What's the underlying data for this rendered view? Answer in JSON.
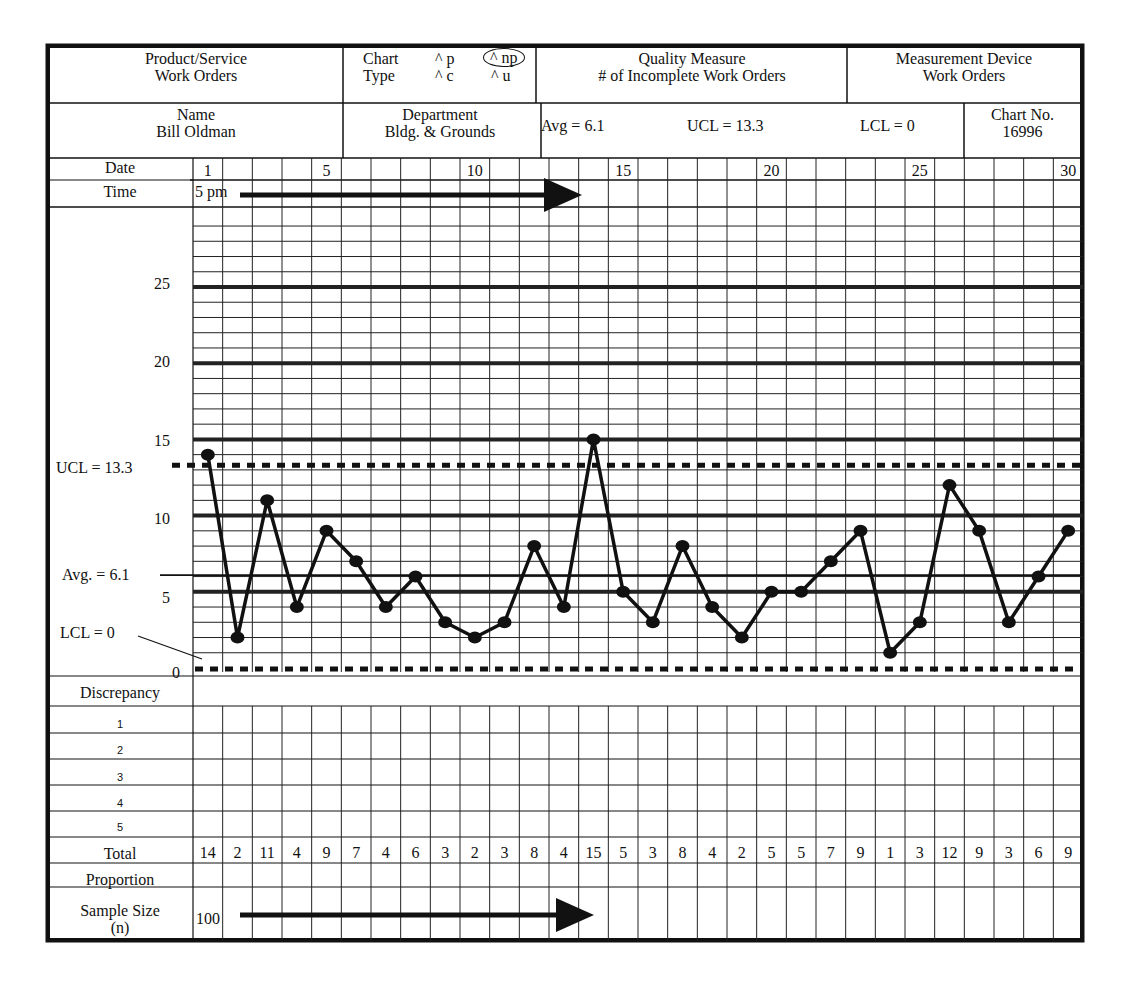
{
  "header": {
    "product_service_label": "Product/Service",
    "product_service_value": "Work Orders",
    "chart_type_label_1": "Chart",
    "chart_type_label_2": "Type",
    "chart_type_options": [
      "^ p",
      "^ np",
      "^ c",
      "^ u"
    ],
    "chart_type_selected": "np",
    "quality_measure_label": "Quality Measure",
    "quality_measure_value": "# of Incomplete Work Orders",
    "measurement_device_label": "Measurement Device",
    "measurement_device_value": "Work Orders",
    "name_label": "Name",
    "name_value": "Bill Oldman",
    "department_label": "Department",
    "department_value": "Bldg. & Grounds",
    "avg_text": "Avg = 6.1",
    "ucl_text": "UCL = 13.3",
    "lcl_text": "LCL = 0",
    "chart_no_label": "Chart No.",
    "chart_no_value": "16996"
  },
  "rows": {
    "date_label": "Date",
    "time_label": "Time",
    "time_value": "5 pm",
    "date_ticks": [
      "1",
      "5",
      "10",
      "15",
      "20",
      "25",
      "30"
    ],
    "discrepancy_label": "Discrepancy",
    "discrepancy_items": [
      "1",
      "2",
      "3",
      "4",
      "5"
    ],
    "total_label": "Total",
    "proportion_label": "Proportion",
    "sample_size_label_1": "Sample Size",
    "sample_size_label_2": "(n)",
    "sample_size_value": "100"
  },
  "annotations": {
    "ucl_label": "UCL = 13.3",
    "avg_label": "Avg. = 6.1",
    "lcl_label": "LCL = 0"
  },
  "chart_data": {
    "type": "line",
    "xlabel": "Date",
    "ylabel": "",
    "x": [
      1,
      2,
      3,
      4,
      5,
      6,
      7,
      8,
      9,
      10,
      11,
      12,
      13,
      14,
      15,
      16,
      17,
      18,
      19,
      20,
      21,
      22,
      23,
      24,
      25,
      26,
      27,
      28,
      29,
      30
    ],
    "series": [
      {
        "name": "Total incomplete",
        "values": [
          14,
          2,
          11,
          4,
          9,
          7,
          4,
          6,
          3,
          2,
          3,
          8,
          4,
          15,
          5,
          3,
          8,
          4,
          2,
          5,
          5,
          7,
          9,
          1,
          3,
          12,
          9,
          3,
          6,
          9
        ]
      }
    ],
    "ylim": [
      0,
      30
    ],
    "yticks": [
      0,
      5,
      10,
      15,
      20,
      25
    ],
    "control_lines": {
      "UCL": 13.3,
      "Avg": 6.1,
      "LCL": 0
    },
    "grid": true,
    "legend": "none"
  },
  "colors": {
    "ink": "#111111",
    "paper": "#ffffff"
  }
}
